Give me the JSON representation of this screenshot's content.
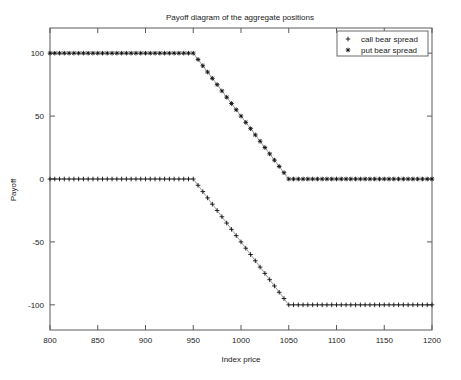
{
  "chart_data": {
    "type": "line",
    "title": "Payoff diagram of the aggregate positions",
    "xlabel": "Index price",
    "ylabel": "Payoff",
    "xlim": [
      800,
      1200
    ],
    "ylim": [
      -120,
      120
    ],
    "xticks": [
      800,
      850,
      900,
      950,
      1000,
      1050,
      1100,
      1150,
      1200
    ],
    "yticks": [
      100,
      50,
      0,
      -50,
      -100
    ],
    "xtick_labels": [
      "800",
      "850",
      "900",
      "950",
      "1000",
      "1050",
      "1100",
      "1150",
      "1200"
    ],
    "ytick_labels": [
      "100",
      "50",
      "0",
      "-50",
      "-100"
    ],
    "grid": false,
    "legend_position": "upper right",
    "marker_step": 5,
    "series": [
      {
        "name": "call bear spread",
        "marker": "+",
        "breakpoints": [
          {
            "x": 800,
            "y": 0
          },
          {
            "x": 950,
            "y": 0
          },
          {
            "x": 1050,
            "y": -100
          },
          {
            "x": 1200,
            "y": -100
          }
        ]
      },
      {
        "name": "put bear spread",
        "marker": "*",
        "breakpoints": [
          {
            "x": 800,
            "y": 100
          },
          {
            "x": 950,
            "y": 100
          },
          {
            "x": 1050,
            "y": 0
          },
          {
            "x": 1200,
            "y": 0
          }
        ]
      }
    ]
  },
  "legend": {
    "entries": [
      {
        "label": "call bear spread",
        "marker": "+"
      },
      {
        "label": "put bear spread",
        "marker": "*"
      }
    ]
  }
}
